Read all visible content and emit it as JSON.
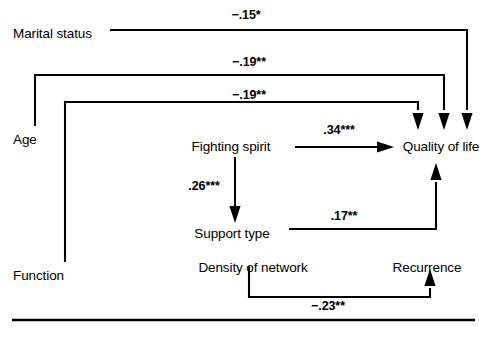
{
  "figure": {
    "type": "path-diagram",
    "background_color": "#ffffff",
    "stroke_color": "#000000",
    "width": 487,
    "height": 338
  },
  "nodes": [
    {
      "id": "marital-status",
      "label": "Marital status"
    },
    {
      "id": "age",
      "label": "Age"
    },
    {
      "id": "function",
      "label": "Function"
    },
    {
      "id": "fighting-spirit",
      "label": "Fighting spirit"
    },
    {
      "id": "support-type",
      "label": "Support type"
    },
    {
      "id": "density-of-network",
      "label": "Density of network"
    },
    {
      "id": "quality-of-life",
      "label": "Quality of life"
    },
    {
      "id": "recurrence",
      "label": "Recurrence"
    }
  ],
  "paths": [
    {
      "id": "marital-to-qol",
      "from": "marital-status",
      "to": "quality-of-life",
      "coefficient": "−.15*",
      "value": -0.15,
      "significance": "*"
    },
    {
      "id": "age-to-qol",
      "from": "age",
      "to": "quality-of-life",
      "coefficient": "−.19**",
      "value": -0.19,
      "significance": "**"
    },
    {
      "id": "function-to-qol",
      "from": "function",
      "to": "quality-of-life",
      "coefficient": "−.19**",
      "value": -0.19,
      "significance": "**"
    },
    {
      "id": "fighting-to-qol",
      "from": "fighting-spirit",
      "to": "quality-of-life",
      "coefficient": ".34***",
      "value": 0.34,
      "significance": "***"
    },
    {
      "id": "fighting-to-support",
      "from": "fighting-spirit",
      "to": "support-type",
      "coefficient": ".26***",
      "value": 0.26,
      "significance": "***"
    },
    {
      "id": "support-to-qol",
      "from": "support-type",
      "to": "quality-of-life",
      "coefficient": ".17**",
      "value": 0.17,
      "significance": "**"
    },
    {
      "id": "density-to-recurrence",
      "from": "density-of-network",
      "to": "recurrence",
      "coefficient": "−.23**",
      "value": -0.23,
      "significance": "**"
    }
  ]
}
